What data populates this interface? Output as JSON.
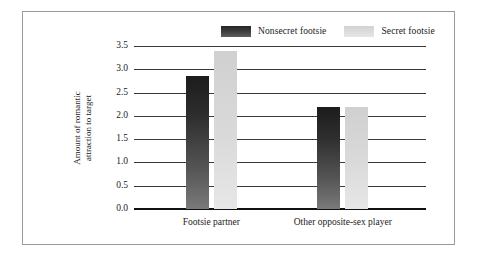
{
  "chart_data": {
    "type": "bar",
    "title": "",
    "subtitle": "",
    "xlabel": "",
    "ylabel": "Amount of romantic attraction to target",
    "ylabel_line1": "Amount of romantic",
    "ylabel_line2": "attraction to target",
    "categories": [
      "Footsie partner",
      "Other opposite-sex player"
    ],
    "series": [
      {
        "name": "Nonsecret footsie",
        "values": [
          2.85,
          2.18
        ],
        "color": "#2e2e2e"
      },
      {
        "name": "Secret footsie",
        "values": [
          3.4,
          2.2
        ],
        "color": "#dadada"
      }
    ],
    "ylim": [
      0.0,
      3.5
    ],
    "ytick_labels": [
      "3.5",
      "3.0",
      "2.5",
      "2.0",
      "1.5",
      "1.0",
      "0.5",
      "0.0"
    ],
    "ytick_values": [
      3.5,
      3.0,
      2.5,
      2.0,
      1.5,
      1.0,
      0.5,
      0.0
    ],
    "grid": true,
    "legend_position": "top-center"
  },
  "legend": {
    "entries": [
      {
        "label": "Nonsecret footsie",
        "swatch": "dark-gradient-swatch"
      },
      {
        "label": "Secret footsie",
        "swatch": "light-gradient-swatch"
      }
    ]
  },
  "colors": {
    "frame_border": "#9a9a9a",
    "gridline": "#3b3b3b",
    "baseline": "#111111",
    "bar_dark": "#2e2e2e",
    "bar_light": "#dadada",
    "background": "#ffffff",
    "text": "#1a1a1a"
  }
}
